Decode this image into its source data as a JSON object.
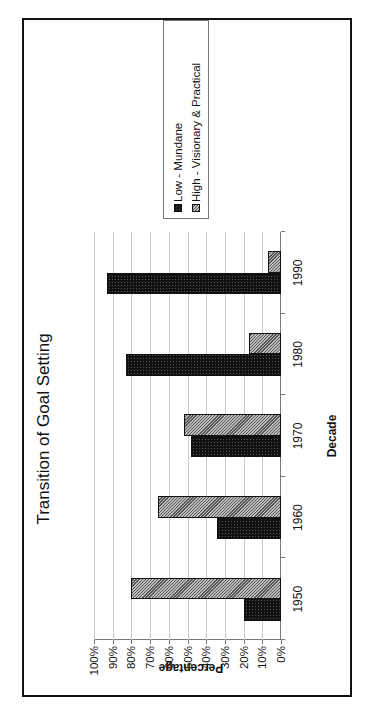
{
  "chart_data": {
    "type": "bar",
    "orientation": "vertical bars, whole figure rotated 90° counter-clockwise",
    "title": "Transition of Goal Setting",
    "xlabel": "Decade",
    "ylabel": "Percentage",
    "categories": [
      "1950",
      "1960",
      "1970",
      "1980",
      "1990"
    ],
    "series": [
      {
        "name": "Low - Mundane",
        "values": [
          20,
          34,
          48,
          83,
          93
        ],
        "color": "#111111",
        "pattern": "dotted"
      },
      {
        "name": "High - Visionary & Practical",
        "values": [
          80,
          66,
          52,
          17,
          7
        ],
        "color": "#9a9a9a",
        "pattern": "diagonal-hatch"
      }
    ],
    "yticks": [
      "0%",
      "10%",
      "20%",
      "30%",
      "40%",
      "50%",
      "60%",
      "70%",
      "80%",
      "90%",
      "100%"
    ],
    "ylim": [
      0,
      100
    ],
    "grid": true,
    "legend_position": "right"
  }
}
